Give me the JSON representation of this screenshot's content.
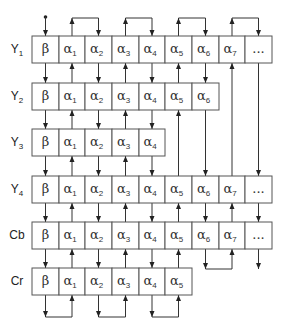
{
  "diagram": {
    "title": "",
    "colors": {
      "line": "#333333",
      "cell_border": "#555555",
      "text": "#222222",
      "background": "#ffffff"
    },
    "geometry": {
      "col_edges": [
        32,
        59,
        85,
        112,
        139,
        165,
        192,
        219,
        245,
        272
      ],
      "row_tops": [
        36,
        83,
        129,
        176,
        222,
        268
      ],
      "row_height": 27
    },
    "columns": [
      {
        "symbol": "β",
        "sub": ""
      },
      {
        "symbol": "α",
        "sub": "1"
      },
      {
        "symbol": "α",
        "sub": "2"
      },
      {
        "symbol": "α",
        "sub": "3"
      },
      {
        "symbol": "α",
        "sub": "4"
      },
      {
        "symbol": "α",
        "sub": "5"
      },
      {
        "symbol": "α",
        "sub": "6"
      },
      {
        "symbol": "α",
        "sub": "7"
      },
      {
        "symbol": "...",
        "sub": ""
      }
    ],
    "rows": [
      {
        "label": "Y",
        "label_sub": "1",
        "cells": 9
      },
      {
        "label": "Y",
        "label_sub": "2",
        "cells": 7
      },
      {
        "label": "Y",
        "label_sub": "3",
        "cells": 5
      },
      {
        "label": "Y",
        "label_sub": "4",
        "cells": 9
      },
      {
        "label": "Cb",
        "label_sub": "",
        "cells": 9
      },
      {
        "label": "Cr",
        "label_sub": "",
        "cells": 6
      }
    ],
    "connections": {
      "start": {
        "col": 0,
        "dir": "down",
        "from_y": 17,
        "to_row": 0
      },
      "top_loops": [
        [
          1,
          2
        ],
        [
          3,
          4
        ],
        [
          5,
          6
        ],
        [
          7,
          8
        ]
      ],
      "top_loop_y": 18,
      "vertical_links": [
        {
          "col": 0,
          "from_row": 0,
          "to_row": 1,
          "dir": "down"
        },
        {
          "col": 1,
          "from_row": 0,
          "to_row": 1,
          "dir": "up"
        },
        {
          "col": 2,
          "from_row": 0,
          "to_row": 1,
          "dir": "down"
        },
        {
          "col": 3,
          "from_row": 0,
          "to_row": 1,
          "dir": "up"
        },
        {
          "col": 4,
          "from_row": 0,
          "to_row": 1,
          "dir": "down"
        },
        {
          "col": 5,
          "from_row": 0,
          "to_row": 1,
          "dir": "up"
        },
        {
          "col": 6,
          "from_row": 0,
          "to_row": 1,
          "dir": "down"
        },
        {
          "col": 7,
          "from_row": 0,
          "to_row": 3,
          "dir": "up"
        },
        {
          "col": 8,
          "from_row": 0,
          "to_row": 3,
          "dir": "down"
        },
        {
          "col": 0,
          "from_row": 1,
          "to_row": 2,
          "dir": "down"
        },
        {
          "col": 1,
          "from_row": 1,
          "to_row": 2,
          "dir": "up"
        },
        {
          "col": 2,
          "from_row": 1,
          "to_row": 2,
          "dir": "down"
        },
        {
          "col": 3,
          "from_row": 1,
          "to_row": 2,
          "dir": "up"
        },
        {
          "col": 4,
          "from_row": 1,
          "to_row": 2,
          "dir": "down"
        },
        {
          "col": 5,
          "from_row": 1,
          "to_row": 3,
          "dir": "up"
        },
        {
          "col": 6,
          "from_row": 1,
          "to_row": 3,
          "dir": "down"
        },
        {
          "col": 0,
          "from_row": 2,
          "to_row": 3,
          "dir": "down"
        },
        {
          "col": 1,
          "from_row": 2,
          "to_row": 3,
          "dir": "up"
        },
        {
          "col": 2,
          "from_row": 2,
          "to_row": 3,
          "dir": "down"
        },
        {
          "col": 3,
          "from_row": 2,
          "to_row": 3,
          "dir": "up"
        },
        {
          "col": 4,
          "from_row": 2,
          "to_row": 3,
          "dir": "down"
        },
        {
          "col": 0,
          "from_row": 3,
          "to_row": 4,
          "dir": "down"
        },
        {
          "col": 1,
          "from_row": 3,
          "to_row": 4,
          "dir": "up"
        },
        {
          "col": 2,
          "from_row": 3,
          "to_row": 4,
          "dir": "down"
        },
        {
          "col": 3,
          "from_row": 3,
          "to_row": 4,
          "dir": "up"
        },
        {
          "col": 4,
          "from_row": 3,
          "to_row": 4,
          "dir": "down"
        },
        {
          "col": 5,
          "from_row": 3,
          "to_row": 4,
          "dir": "up"
        },
        {
          "col": 6,
          "from_row": 3,
          "to_row": 4,
          "dir": "down"
        },
        {
          "col": 7,
          "from_row": 3,
          "to_row": 4,
          "dir": "up"
        },
        {
          "col": 8,
          "from_row": 3,
          "to_row": 4,
          "dir": "down"
        },
        {
          "col": 0,
          "from_row": 4,
          "to_row": 5,
          "dir": "down"
        },
        {
          "col": 1,
          "from_row": 4,
          "to_row": 5,
          "dir": "up"
        },
        {
          "col": 2,
          "from_row": 4,
          "to_row": 5,
          "dir": "down"
        },
        {
          "col": 3,
          "from_row": 4,
          "to_row": 5,
          "dir": "up"
        },
        {
          "col": 4,
          "from_row": 4,
          "to_row": 5,
          "dir": "down"
        },
        {
          "col": 5,
          "from_row": 4,
          "to_row": 5,
          "dir": "up"
        }
      ],
      "cb_bottom_loops": [
        [
          6,
          7
        ]
      ],
      "cb_bottom_loop_y": 269,
      "cb_end_stub": {
        "col": 8,
        "to_y": 269
      },
      "cr_bottom_loops": [
        [
          0,
          1
        ],
        [
          2,
          3
        ],
        [
          4,
          5
        ]
      ],
      "cr_bottom_loop_y": 317
    }
  }
}
